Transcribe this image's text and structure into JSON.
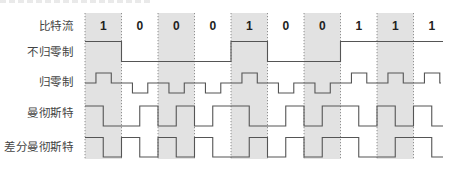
{
  "chart_data": {
    "type": "diagram",
    "title": "",
    "bits": [
      1,
      0,
      0,
      0,
      1,
      0,
      0,
      1,
      1,
      1
    ],
    "bit_labels": [
      "1",
      "0",
      "0",
      "0",
      "1",
      "0",
      "0",
      "1",
      "1",
      "1"
    ],
    "shaded_bit_indices": [
      0,
      2,
      4,
      6,
      8
    ],
    "rows": [
      {
        "key": "bitstream",
        "label": "比特流"
      },
      {
        "key": "nrz",
        "label": "不归零制"
      },
      {
        "key": "rz",
        "label": "归零制"
      },
      {
        "key": "manchester",
        "label": "曼彻斯特"
      },
      {
        "key": "diff_manchester",
        "label": "差分曼彻斯特"
      }
    ],
    "encoding_rules": {
      "nrz": "1 = high, 0 = low",
      "rz": "1 = positive pulse mid-bit, 0 = negative pulse mid-bit, returns to zero",
      "manchester": "1 = high-to-low, 0 = low-to-high",
      "diff_manchester": "always mid-bit transition; 0 = transition at bit start, 1 = no transition at start"
    }
  },
  "labels": {
    "bitstream": "比特流",
    "nrz": "不归零制",
    "rz": "归零制",
    "manchester": "曼彻斯特",
    "diff_manchester": "差分曼彻斯特"
  },
  "colors": {
    "shade": "#e2e2e2",
    "line": "#555555",
    "grid": "#777777",
    "text": "#333333"
  }
}
